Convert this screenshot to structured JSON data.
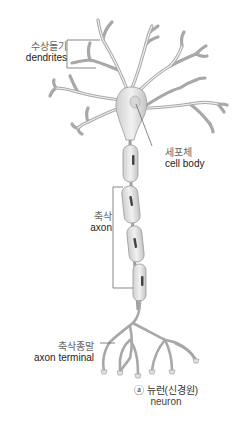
{
  "figure": {
    "title_marker": "ⓐ",
    "title_ko": "뉴런(신경원)",
    "title_en": "neuron"
  },
  "labels": {
    "dendrites": {
      "ko": "수상돌기",
      "en": "dendrites"
    },
    "cell_body": {
      "ko": "세포체",
      "en": "cell body"
    },
    "axon": {
      "ko": "축삭",
      "en": "axon"
    },
    "axon_terminal": {
      "ko": "축삭종말",
      "en": "axon terminal"
    }
  },
  "caption": {
    "ko": "ⓐ 뉴런(신경원)",
    "en": "neuron"
  },
  "colors": {
    "background": "#ffffff",
    "neuron_fill": "#e2e2e2",
    "neuron_stroke": "#9a9a9a",
    "myelin_fill": "#dcdcdc",
    "nucleus": "#444444",
    "leader_line": "#555555"
  }
}
